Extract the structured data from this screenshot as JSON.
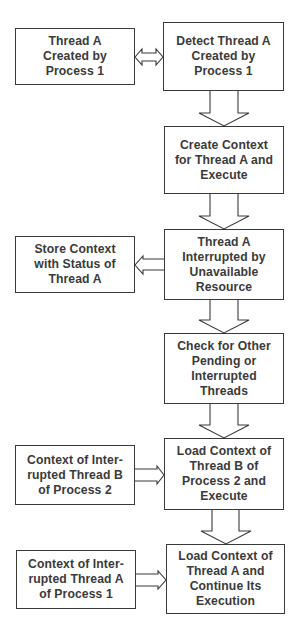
{
  "diagram": {
    "type": "flowchart",
    "top_cutoff_text": "",
    "nodes": [
      {
        "id": "n1",
        "label": "Thread A\nCreated by\nProcess 1"
      },
      {
        "id": "n2",
        "label": "Detect Thread A\nCreated by\nProcess 1"
      },
      {
        "id": "n3",
        "label": "Create Context\nfor Thread A and\nExecute"
      },
      {
        "id": "n4",
        "label": "Store Context\nwith Status of\nThread A"
      },
      {
        "id": "n5",
        "label": "Thread A\nInterrupted by\nUnavailable\nResource"
      },
      {
        "id": "n6",
        "label": "Check for Other\nPending or\nInterrupted\nThreads"
      },
      {
        "id": "n7",
        "label": "Context of Inter-\nrupted Thread B\nof Process 2"
      },
      {
        "id": "n8",
        "label": "Load Context of\nThread B of\nProcess 2 and\nExecute"
      },
      {
        "id": "n9",
        "label": "Context of Inter-\nrupted Thread A\nof Process 1"
      },
      {
        "id": "n10",
        "label": "Load Context of\nThread A and\nContinue Its\nExecution"
      }
    ],
    "edges": [
      {
        "from": "n1",
        "to": "n2",
        "style": "double-headed-block-arrow"
      },
      {
        "from": "n2",
        "to": "n3",
        "style": "down-block-arrow"
      },
      {
        "from": "n3",
        "to": "n5",
        "style": "down-block-arrow"
      },
      {
        "from": "n5",
        "to": "n4",
        "style": "left-block-arrow"
      },
      {
        "from": "n5",
        "to": "n6",
        "style": "down-block-arrow"
      },
      {
        "from": "n6",
        "to": "n8",
        "style": "down-block-arrow"
      },
      {
        "from": "n7",
        "to": "n8",
        "style": "right-block-arrow"
      },
      {
        "from": "n8",
        "to": "n10",
        "style": "down-block-arrow"
      },
      {
        "from": "n9",
        "to": "n10",
        "style": "right-block-arrow"
      }
    ],
    "colors": {
      "stroke": "#3a3a3a",
      "text": "#3a3a3a",
      "fill": "#ffffff",
      "background": "#ffffff"
    }
  }
}
